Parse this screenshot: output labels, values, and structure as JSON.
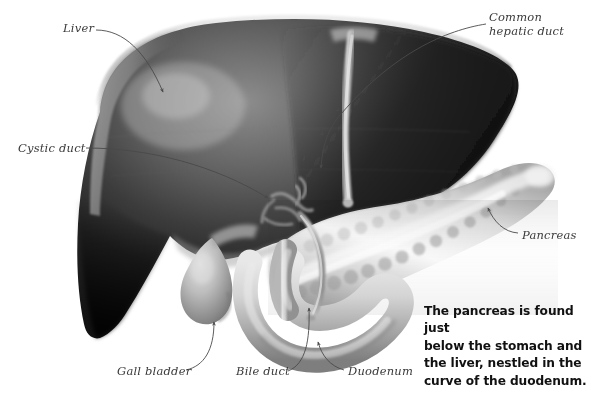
{
  "figure": {
    "background_color": "#ffffff"
  },
  "labels": [
    {
      "id": "liver",
      "text": "Liver",
      "x": 63,
      "y": 22,
      "multiline": false
    },
    {
      "id": "common-hepatic-duct",
      "text": "Common hepatic duct",
      "x": 489,
      "y": 11,
      "multiline": true
    },
    {
      "id": "cystic-duct",
      "text": "Cystic duct",
      "x": 18,
      "y": 142,
      "multiline": false
    },
    {
      "id": "pancreas",
      "text": "Pancreas",
      "x": 522,
      "y": 229,
      "multiline": false
    },
    {
      "id": "gall-bladder",
      "text": "Gall bladder",
      "x": 117,
      "y": 365,
      "multiline": false
    },
    {
      "id": "bile-duct",
      "text": "Bile duct",
      "x": 236,
      "y": 365,
      "multiline": false
    },
    {
      "id": "duodenum",
      "text": "Duodenum",
      "x": 348,
      "y": 365,
      "multiline": false
    }
  ],
  "caption": {
    "lines": [
      "The pancreas is found just",
      "below the stomach and",
      "the liver, nestled in the",
      "curve of the duodenum."
    ],
    "color": "#111111"
  },
  "colors": {
    "liver_dark": "#1a1a1a",
    "liver_mid": "#5e5e5e",
    "liver_highlight": "#c9c9c9",
    "liver_rim": "#d8d8d8",
    "pancreas_light": "#f4f4f4",
    "pancreas_shade": "#9a9a9a",
    "duct_light": "#d9d9d9",
    "duct_mid": "#a8a8a8",
    "gallbladder": "#b9b9b9",
    "duodenum": "#c4c4c4",
    "leader_line": "#4a4a4a",
    "label_text": "#3a3a3a"
  },
  "structures": [
    {
      "name": "liver",
      "note": "large dark organ occupying upper-left two thirds"
    },
    {
      "name": "falciform-ligament",
      "note": "pale vertical band crossing liver"
    },
    {
      "name": "common-hepatic-duct",
      "note": "duct emerging below liver"
    },
    {
      "name": "cystic-duct",
      "note": "branching duct tree at liver underside"
    },
    {
      "name": "gall-bladder",
      "note": "pear-shaped sac under liver left of centre"
    },
    {
      "name": "bile-duct",
      "note": "duct descending to duodenum"
    },
    {
      "name": "pancreas",
      "note": "elongated lobulated gland running to upper right"
    },
    {
      "name": "duodenum",
      "note": "C-shaped loop curving below pancreas head"
    }
  ]
}
